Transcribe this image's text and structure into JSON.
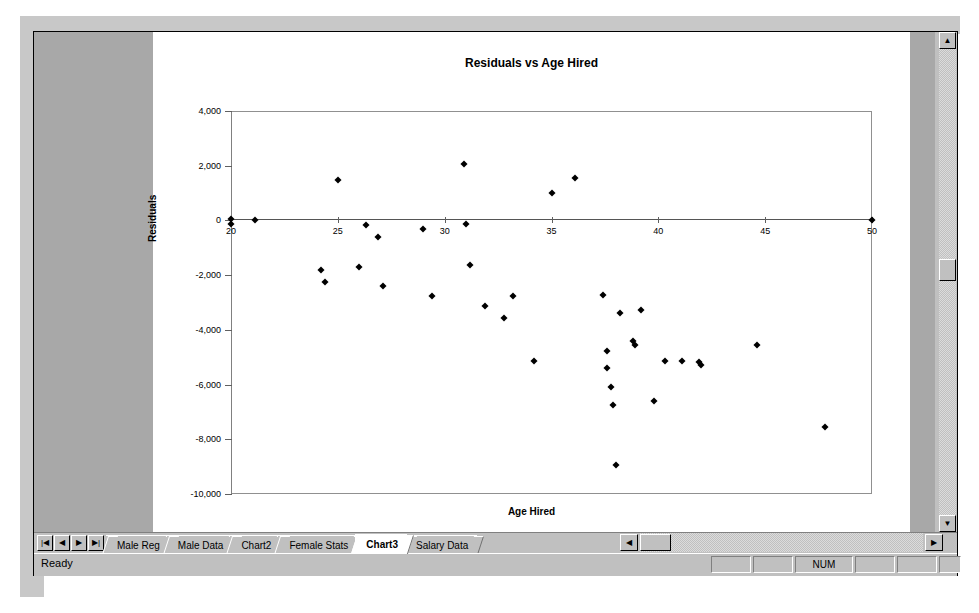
{
  "application": {
    "status_text": "Ready",
    "status_indicators": [
      "",
      "",
      "NUM",
      "",
      "",
      ""
    ]
  },
  "sheet_tabs": {
    "nav_buttons": [
      {
        "name": "first-sheet",
        "glyph": "|◀"
      },
      {
        "name": "prev-sheet",
        "glyph": "◀"
      },
      {
        "name": "next-sheet",
        "glyph": "▶"
      },
      {
        "name": "last-sheet",
        "glyph": "▶|"
      }
    ],
    "tabs": [
      {
        "label": "Male Reg",
        "active": false
      },
      {
        "label": "Male Data",
        "active": false
      },
      {
        "label": "Chart2",
        "active": false
      },
      {
        "label": "Female Stats",
        "active": false
      },
      {
        "label": "Chart3",
        "active": true
      },
      {
        "label": "Salary Data",
        "active": false
      }
    ]
  },
  "scrollbars": {
    "vertical": {
      "up_glyph": "▲",
      "down_glyph": "▼"
    },
    "horizontal": {
      "left_glyph": "◀",
      "right_glyph": "▶"
    }
  },
  "chart_data": {
    "type": "scatter",
    "title": "Residuals vs Age Hired",
    "xlabel": "Age Hired",
    "ylabel": "Residuals",
    "xlim": [
      20,
      50
    ],
    "ylim": [
      -10000,
      4000
    ],
    "xticks": [
      20,
      25,
      30,
      35,
      40,
      45,
      50
    ],
    "yticks": [
      4000,
      2000,
      0,
      -2000,
      -4000,
      -6000,
      -8000,
      -10000
    ],
    "ytick_labels": [
      "4,000",
      "2,000",
      "0",
      "-2,000",
      "-4,000",
      "-6,000",
      "-8,000",
      "-10,000"
    ],
    "xtick_labels": [
      "20",
      "25",
      "30",
      "35",
      "40",
      "45",
      "50"
    ],
    "grid": false,
    "legend": false,
    "marker": "diamond",
    "marker_color": "#000000",
    "reference_line_y": 0,
    "points": [
      {
        "x": 20.0,
        "y": 60
      },
      {
        "x": 20.0,
        "y": -130
      },
      {
        "x": 21.1,
        "y": 0
      },
      {
        "x": 24.2,
        "y": -1800
      },
      {
        "x": 24.4,
        "y": -2250
      },
      {
        "x": 25.0,
        "y": 1480
      },
      {
        "x": 26.0,
        "y": -1720
      },
      {
        "x": 26.3,
        "y": -170
      },
      {
        "x": 26.9,
        "y": -600
      },
      {
        "x": 27.1,
        "y": -2400
      },
      {
        "x": 29.0,
        "y": -330
      },
      {
        "x": 29.4,
        "y": -2750
      },
      {
        "x": 30.9,
        "y": 2060
      },
      {
        "x": 31.0,
        "y": -130
      },
      {
        "x": 31.2,
        "y": -1640
      },
      {
        "x": 31.9,
        "y": -3120
      },
      {
        "x": 32.8,
        "y": -3560
      },
      {
        "x": 33.2,
        "y": -2780
      },
      {
        "x": 34.2,
        "y": -5140
      },
      {
        "x": 35.0,
        "y": 1000
      },
      {
        "x": 36.1,
        "y": 1550
      },
      {
        "x": 37.4,
        "y": -2720
      },
      {
        "x": 37.6,
        "y": -4760
      },
      {
        "x": 37.6,
        "y": -5390
      },
      {
        "x": 37.8,
        "y": -6100
      },
      {
        "x": 37.9,
        "y": -6740
      },
      {
        "x": 38.0,
        "y": -8950
      },
      {
        "x": 38.2,
        "y": -3400
      },
      {
        "x": 38.8,
        "y": -4400
      },
      {
        "x": 38.9,
        "y": -4560
      },
      {
        "x": 39.2,
        "y": -3260
      },
      {
        "x": 39.8,
        "y": -6590
      },
      {
        "x": 40.3,
        "y": -5150
      },
      {
        "x": 41.1,
        "y": -5140
      },
      {
        "x": 41.9,
        "y": -5180
      },
      {
        "x": 42.0,
        "y": -5280
      },
      {
        "x": 44.6,
        "y": -4570
      },
      {
        "x": 47.8,
        "y": -7540
      },
      {
        "x": 50.0,
        "y": 0
      }
    ]
  }
}
